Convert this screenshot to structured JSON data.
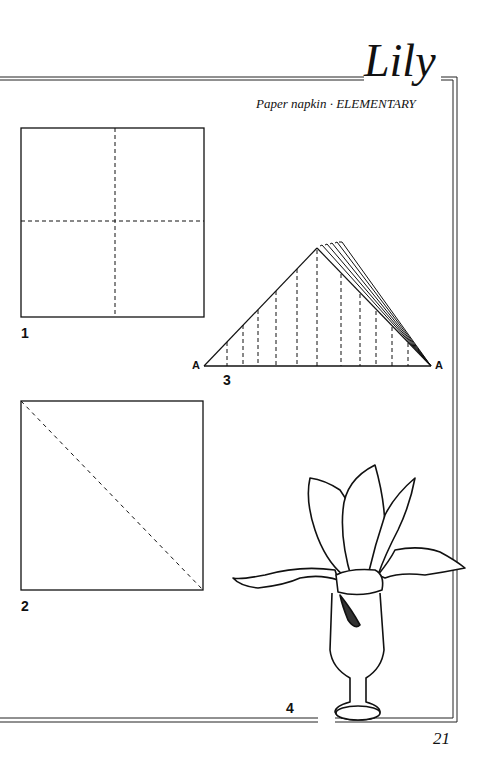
{
  "header": {
    "title": "Lily",
    "subtitle": "Paper napkin · ELEMENTARY"
  },
  "steps": [
    {
      "number": "1",
      "description": "square napkin with center fold lines"
    },
    {
      "number": "2",
      "description": "square napkin with diagonal fold line"
    },
    {
      "number": "3",
      "description": "triangle pleated accordion-style",
      "point_labels": [
        "A",
        "A"
      ]
    },
    {
      "number": "4",
      "description": "lily napkin in stemmed glass"
    }
  ],
  "footer": {
    "page_number": "21"
  }
}
